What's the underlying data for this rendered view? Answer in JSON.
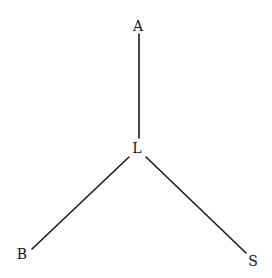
{
  "diagram": {
    "type": "tree",
    "nodes": [
      {
        "id": "A",
        "label": "A",
        "x": 138,
        "y": 27
      },
      {
        "id": "L",
        "label": "L",
        "x": 137,
        "y": 149
      },
      {
        "id": "B",
        "label": "B",
        "x": 22,
        "y": 255
      },
      {
        "id": "S",
        "label": "S",
        "x": 253,
        "y": 262
      }
    ],
    "edges": [
      {
        "from": "A",
        "to": "L",
        "x1": 139,
        "y1": 34,
        "x2": 139,
        "y2": 138
      },
      {
        "from": "L",
        "to": "B",
        "x1": 129,
        "y1": 157,
        "x2": 32,
        "y2": 249
      },
      {
        "from": "L",
        "to": "S",
        "x1": 146,
        "y1": 157,
        "x2": 246,
        "y2": 253
      }
    ],
    "colors": {
      "line": "#1a1a1a",
      "text": "#111111",
      "background": "#ffffff"
    }
  }
}
